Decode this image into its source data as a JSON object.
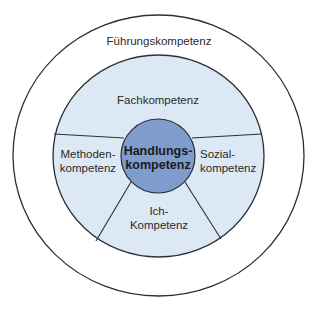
{
  "diagram": {
    "outer_ring": {
      "label": "Führungskompetenz"
    },
    "segments": {
      "top": {
        "label": "Fachkompetenz"
      },
      "left": {
        "line1": "Methoden-",
        "line2": "kompetenz"
      },
      "right": {
        "line1": "Sozial-",
        "line2": "kompetenz"
      },
      "bottom": {
        "line1": "Ich-",
        "line2": "Kompetenz"
      }
    },
    "center": {
      "line1": "Handlungs-",
      "line2": "kompetenz"
    },
    "colors": {
      "outer_fill": "#ffffff",
      "inner_fill": "#dce9f5",
      "center_fill": "#7f9ccc",
      "stroke": "#2b2f38"
    }
  }
}
